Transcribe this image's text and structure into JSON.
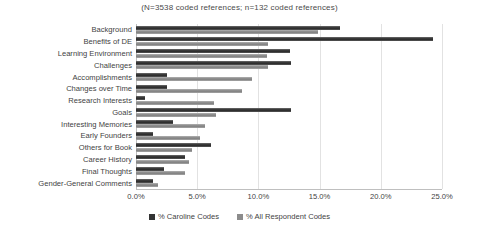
{
  "chart_data": {
    "type": "bar",
    "orientation": "horizontal",
    "title": "(N=3538 coded references; n=132 coded references)",
    "xlabel": "",
    "ylabel": "",
    "xlim": [
      0,
      25
    ],
    "xticks": [
      "0.0%",
      "5.0%",
      "10.0%",
      "15.0%",
      "20.0%",
      "25.0%"
    ],
    "xtick_values": [
      0,
      5,
      10,
      15,
      20,
      25
    ],
    "grid": true,
    "legend_position": "bottom",
    "categories": [
      "Background",
      "Benefits of DE",
      "Learning Environment",
      "Challenges",
      "Accomplishments",
      "Changes over Time",
      "Research Interests",
      "Goals",
      "Interesting Memories",
      "Early Founders",
      "Others for Book",
      "Career History",
      "Final Thoughts",
      "Gender-General Comments"
    ],
    "series": [
      {
        "name": "% Caroline Codes",
        "color": "#333333",
        "values": [
          16.7,
          24.3,
          12.6,
          12.7,
          2.5,
          2.5,
          0.7,
          12.7,
          3.0,
          1.4,
          6.1,
          4.0,
          2.3,
          1.4
        ]
      },
      {
        "name": "% All Respondent Codes",
        "color": "#8c8c8c",
        "values": [
          14.9,
          10.8,
          10.7,
          10.8,
          9.5,
          8.7,
          6.4,
          6.5,
          5.6,
          5.2,
          4.6,
          4.3,
          4.0,
          1.8
        ]
      }
    ]
  }
}
